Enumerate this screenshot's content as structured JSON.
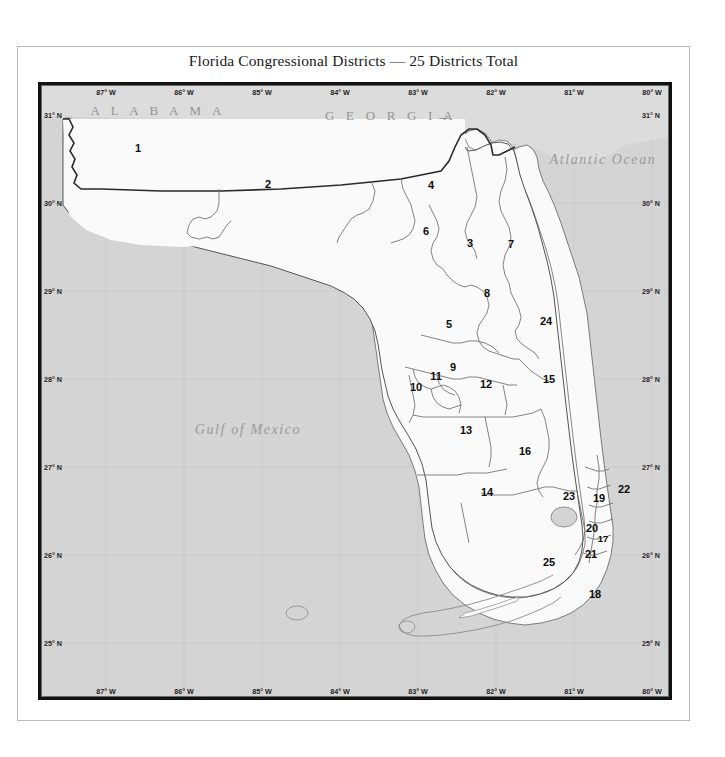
{
  "title": "Florida Congressional Districts — 25 Districts Total",
  "colors": {
    "ocean": "#d4d4d4",
    "land": "#fafafa",
    "neighbor_state": "#dcdcdc",
    "frame": "#111111",
    "district_line": "#6e6e6e",
    "state_border": "#2a2a2a",
    "grid": "#c2c2c2",
    "label_gray": "#949494"
  },
  "axes": {
    "longitude_ticks": [
      {
        "label": "87° W",
        "x": 106
      },
      {
        "label": "86° W",
        "x": 184
      },
      {
        "label": "85° W",
        "x": 262
      },
      {
        "label": "84° W",
        "x": 340
      },
      {
        "label": "83° W",
        "x": 418
      },
      {
        "label": "82° W",
        "x": 496
      },
      {
        "label": "81° W",
        "x": 574
      },
      {
        "label": "80° W",
        "x": 652
      }
    ],
    "latitude_ticks": [
      {
        "label": "31° N",
        "y": 115
      },
      {
        "label": "30° N",
        "y": 203
      },
      {
        "label": "29° N",
        "y": 291
      },
      {
        "label": "28° N",
        "y": 379
      },
      {
        "label": "27° N",
        "y": 467
      },
      {
        "label": "26° N",
        "y": 555
      },
      {
        "label": "25° N",
        "y": 643
      }
    ]
  },
  "place_labels": [
    {
      "name": "alabama",
      "text": "A L A B A M A",
      "x": 155,
      "y": 108,
      "kind": "state"
    },
    {
      "name": "georgia",
      "text": "G E O R G I A",
      "x": 388,
      "y": 113,
      "kind": "state"
    },
    {
      "name": "atlantic-ocean",
      "text": "Atlantic Ocean",
      "x": 600,
      "y": 157,
      "kind": "water"
    },
    {
      "name": "gulf-of-mexico",
      "text": "Gulf of Mexico",
      "x": 245,
      "y": 427,
      "kind": "water"
    }
  ],
  "compass": {
    "label": "N"
  },
  "districts": [
    {
      "id": "1",
      "x": 135,
      "y": 145
    },
    {
      "id": "2",
      "x": 265,
      "y": 181
    },
    {
      "id": "3",
      "x": 467,
      "y": 240
    },
    {
      "id": "4",
      "x": 428,
      "y": 182
    },
    {
      "id": "5",
      "x": 446,
      "y": 321
    },
    {
      "id": "6",
      "x": 423,
      "y": 228
    },
    {
      "id": "7",
      "x": 508,
      "y": 241
    },
    {
      "id": "8",
      "x": 484,
      "y": 290
    },
    {
      "id": "9",
      "x": 450,
      "y": 364
    },
    {
      "id": "10",
      "x": 413,
      "y": 384
    },
    {
      "id": "11",
      "x": 433,
      "y": 373
    },
    {
      "id": "12",
      "x": 483,
      "y": 381
    },
    {
      "id": "13",
      "x": 463,
      "y": 427
    },
    {
      "id": "14",
      "x": 484,
      "y": 489
    },
    {
      "id": "15",
      "x": 546,
      "y": 376
    },
    {
      "id": "16",
      "x": 522,
      "y": 448
    },
    {
      "id": "17",
      "x": 600,
      "y": 535,
      "small": true
    },
    {
      "id": "18",
      "x": 592,
      "y": 591
    },
    {
      "id": "19",
      "x": 596,
      "y": 495
    },
    {
      "id": "20",
      "x": 589,
      "y": 525
    },
    {
      "id": "21",
      "x": 588,
      "y": 551
    },
    {
      "id": "22",
      "x": 621,
      "y": 486
    },
    {
      "id": "23",
      "x": 566,
      "y": 493
    },
    {
      "id": "24",
      "x": 543,
      "y": 318
    },
    {
      "id": "25",
      "x": 546,
      "y": 559
    }
  ]
}
